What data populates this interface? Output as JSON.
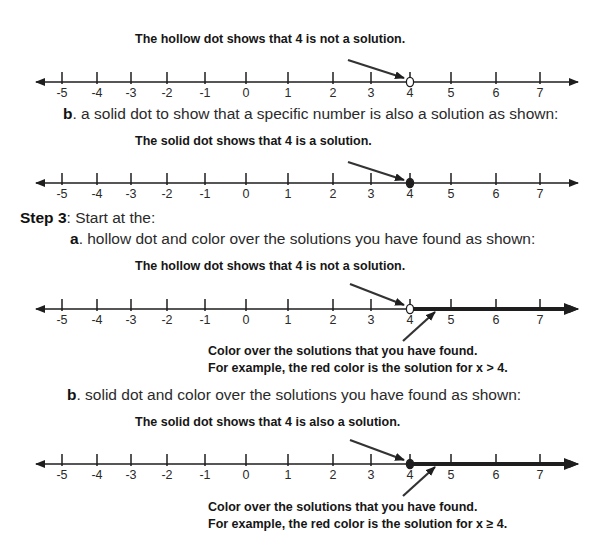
{
  "colors": {
    "ink": "#1e1e1e",
    "text": "#2a2a2a",
    "background": "#ffffff"
  },
  "number_line_ticks": [
    "-5",
    "-4",
    "-3",
    "-2",
    "-1",
    "0",
    "1",
    "2",
    "3",
    "4",
    "5",
    "6",
    "7"
  ],
  "sections": {
    "line1": {
      "caption": "The hollow dot shows that 4 is not a solution.",
      "dot": "hollow",
      "dot_value": "4",
      "shaded_ray": false
    },
    "part_b_intro": {
      "letter": "b",
      "text": ". a solid dot to show that a specific number is also a solution as shown:"
    },
    "line2": {
      "caption": "The solid dot shows that 4 is a solution.",
      "dot": "solid",
      "dot_value": "4",
      "shaded_ray": false
    },
    "step3": {
      "label": "Step 3",
      "text": ": Start at the:"
    },
    "step3_a": {
      "letter": "a",
      "text": ". hollow dot and color over the solutions you have found as shown:"
    },
    "line3": {
      "caption": "The hollow dot shows that 4 is not a solution.",
      "dot": "hollow",
      "dot_value": "4",
      "shaded_ray": true,
      "note_line1": "Color over the solutions that you have found.",
      "note_line2": "For example, the red color is the solution for x > 4."
    },
    "step3_b": {
      "letter": "b",
      "text": ". solid dot and color over the solutions you have found as shown:"
    },
    "line4": {
      "caption": "The solid dot shows that 4 is also a solution.",
      "dot": "solid",
      "dot_value": "4",
      "shaded_ray": true,
      "note_line1": "Color over the solutions that you have found.",
      "note_line2": "For example, the red color is the solution for x ≥ 4."
    }
  }
}
